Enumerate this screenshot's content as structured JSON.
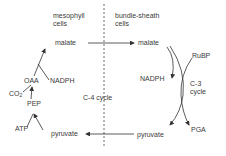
{
  "diagram": {
    "regions": {
      "mesophyll": {
        "line1": "mesophyll",
        "line2": "cells"
      },
      "bundle_sheath": {
        "line1": "bundle-sheath",
        "line2": "cells"
      }
    },
    "mesophyll_nodes": {
      "malate": "malate",
      "oaa": "OAA",
      "nadph": "NADPH",
      "co2": "CO",
      "co2_sub": "2",
      "pep": "PEP",
      "atp": "ATP",
      "pyruvate": "pyruvate"
    },
    "bundle_sheath_nodes": {
      "malate": "malate",
      "rubp": "RuBP",
      "nadph": "NADPH",
      "c3_line1": "C-3",
      "c3_line2": "cycle",
      "pga": "PGA",
      "pyruvate": "pyruvate"
    },
    "center_label": "C-4 cycle",
    "colors": {
      "line": "#333333",
      "text": "#3a3a3a",
      "background": "#ffffff"
    }
  }
}
